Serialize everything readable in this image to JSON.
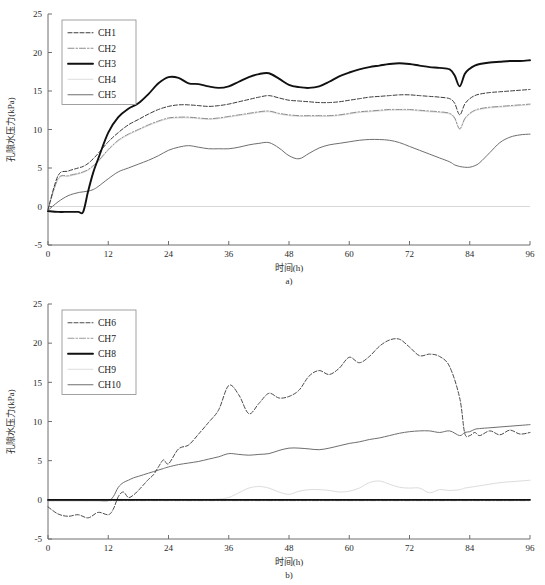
{
  "figure": {
    "panels": [
      {
        "id": "a",
        "sublabel": "a)",
        "xlabel": "时间(h)",
        "ylabel": "孔隙水压力(kPa)",
        "legend": [
          {
            "label": "CH1",
            "style": "dashed",
            "color": "#3a3a3a",
            "width": 1.0,
            "dash": "4,2"
          },
          {
            "label": "CH2",
            "style": "dashdot",
            "color": "#8c8c8c",
            "width": 1.0,
            "dash": "6,2,1.5,2"
          },
          {
            "label": "CH3",
            "style": "solid",
            "color": "#111111",
            "width": 1.9,
            "dash": "none"
          },
          {
            "label": "CH4",
            "style": "solid",
            "color": "#dcdcdc",
            "width": 1.0,
            "dash": "none"
          },
          {
            "label": "CH5",
            "style": "solid",
            "color": "#6e6e6e",
            "width": 1.0,
            "dash": "none"
          }
        ]
      },
      {
        "id": "b",
        "sublabel": "b)",
        "xlabel": "时间(h)",
        "ylabel": "孔隙水压力(kPa)",
        "legend": [
          {
            "label": "CH6",
            "style": "dashed",
            "color": "#4a4a4a",
            "width": 1.0,
            "dash": "4,2"
          },
          {
            "label": "CH7",
            "style": "dashdot",
            "color": "#9a9a9a",
            "width": 1.0,
            "dash": "6,2,1.5,2"
          },
          {
            "label": "CH8",
            "style": "solid",
            "color": "#111111",
            "width": 1.9,
            "dash": "none"
          },
          {
            "label": "CH9",
            "style": "solid",
            "color": "#dcdcdc",
            "width": 1.0,
            "dash": "none"
          },
          {
            "label": "CH10",
            "style": "solid",
            "color": "#6e6e6e",
            "width": 1.0,
            "dash": "none"
          }
        ]
      }
    ]
  },
  "chart_data": [
    {
      "type": "line",
      "panel": "a",
      "title": "",
      "xlabel": "时间(h)",
      "ylabel": "孔隙水压力(kPa)",
      "xlim": [
        0,
        96
      ],
      "ylim": [
        -5,
        25
      ],
      "xticks": [
        0,
        12,
        24,
        36,
        48,
        60,
        72,
        84,
        96
      ],
      "yticks": [
        -5,
        0,
        5,
        10,
        15,
        20,
        25
      ],
      "grid": false,
      "legend_position": "upper-left",
      "x": [
        0,
        2,
        4,
        6,
        7,
        8,
        9,
        10,
        12,
        14,
        16,
        18,
        20,
        22,
        24,
        26,
        28,
        30,
        32,
        34,
        36,
        38,
        40,
        42,
        44,
        46,
        48,
        50,
        52,
        54,
        56,
        58,
        60,
        62,
        64,
        66,
        68,
        70,
        72,
        74,
        76,
        78,
        80,
        81,
        82,
        83,
        84,
        85,
        86,
        88,
        90,
        92,
        94,
        96
      ],
      "series": [
        {
          "name": "CH1",
          "values": [
            -0.4,
            4.0,
            4.6,
            5.0,
            5.2,
            5.6,
            6.2,
            6.9,
            8.4,
            9.6,
            10.6,
            11.3,
            12.0,
            12.6,
            13.0,
            13.2,
            13.2,
            13.1,
            13.0,
            13.1,
            13.3,
            13.6,
            13.9,
            14.2,
            14.4,
            14.1,
            13.8,
            13.7,
            13.6,
            13.5,
            13.5,
            13.6,
            13.8,
            14.0,
            14.2,
            14.3,
            14.4,
            14.5,
            14.5,
            14.4,
            14.3,
            14.2,
            14.0,
            13.4,
            11.9,
            13.3,
            14.0,
            14.4,
            14.6,
            14.8,
            14.9,
            15.0,
            15.1,
            15.2
          ]
        },
        {
          "name": "CH2",
          "values": [
            -0.4,
            3.6,
            4.0,
            4.3,
            4.5,
            4.8,
            5.3,
            5.9,
            7.4,
            8.6,
            9.4,
            10.0,
            10.6,
            11.1,
            11.5,
            11.6,
            11.6,
            11.5,
            11.4,
            11.5,
            11.7,
            11.9,
            12.1,
            12.3,
            12.4,
            12.1,
            11.9,
            11.8,
            11.8,
            11.8,
            11.8,
            11.9,
            12.1,
            12.3,
            12.4,
            12.5,
            12.6,
            12.6,
            12.6,
            12.5,
            12.4,
            12.3,
            12.1,
            11.5,
            10.1,
            11.4,
            12.1,
            12.5,
            12.7,
            12.9,
            13.0,
            13.1,
            13.2,
            13.3
          ]
        },
        {
          "name": "CH3",
          "values": [
            -0.6,
            -0.7,
            -0.7,
            -0.7,
            -0.7,
            2.0,
            4.4,
            6.2,
            9.6,
            11.6,
            12.7,
            13.4,
            14.6,
            16.0,
            16.8,
            16.7,
            16.0,
            15.9,
            15.6,
            15.4,
            15.6,
            16.2,
            16.8,
            17.2,
            17.3,
            16.6,
            15.8,
            15.5,
            15.4,
            15.6,
            16.2,
            16.9,
            17.4,
            17.8,
            18.1,
            18.3,
            18.5,
            18.6,
            18.5,
            18.3,
            18.1,
            18.0,
            17.8,
            17.0,
            15.6,
            17.2,
            17.9,
            18.3,
            18.5,
            18.7,
            18.8,
            18.9,
            18.9,
            19.0
          ]
        },
        {
          "name": "CH4",
          "values": [
            -0.4,
            3.5,
            3.9,
            4.2,
            4.4,
            4.7,
            5.2,
            5.8,
            7.3,
            8.5,
            9.3,
            9.9,
            10.5,
            11.0,
            11.4,
            11.5,
            11.5,
            11.4,
            11.3,
            11.4,
            11.6,
            11.8,
            12.0,
            12.2,
            12.3,
            12.0,
            11.8,
            11.7,
            11.7,
            11.7,
            11.7,
            11.8,
            12.0,
            12.2,
            12.3,
            12.4,
            12.5,
            12.5,
            12.5,
            12.4,
            12.3,
            12.2,
            12.0,
            11.4,
            10.0,
            11.3,
            12.0,
            12.4,
            12.6,
            12.8,
            12.9,
            13.0,
            13.1,
            13.2
          ]
        },
        {
          "name": "CH5",
          "values": [
            -0.5,
            0.6,
            1.4,
            1.8,
            1.9,
            2.0,
            2.2,
            2.6,
            3.6,
            4.5,
            5.0,
            5.5,
            6.0,
            6.6,
            7.3,
            7.7,
            7.9,
            7.7,
            7.5,
            7.5,
            7.5,
            7.7,
            8.0,
            8.2,
            8.3,
            7.6,
            6.6,
            6.2,
            6.9,
            7.6,
            8.0,
            8.2,
            8.4,
            8.6,
            8.7,
            8.7,
            8.6,
            8.3,
            7.8,
            7.3,
            6.8,
            6.3,
            5.8,
            5.4,
            5.2,
            5.1,
            5.1,
            5.3,
            5.7,
            7.0,
            8.3,
            9.0,
            9.3,
            9.4
          ]
        }
      ]
    },
    {
      "type": "line",
      "panel": "b",
      "title": "",
      "xlabel": "时间(h)",
      "ylabel": "孔隙水压力(kPa)",
      "xlim": [
        0,
        96
      ],
      "ylim": [
        -5,
        25
      ],
      "xticks": [
        0,
        12,
        24,
        36,
        48,
        60,
        72,
        84,
        96
      ],
      "yticks": [
        -5,
        0,
        5,
        10,
        15,
        20,
        25
      ],
      "grid": false,
      "legend_position": "upper-left",
      "x": [
        0,
        2,
        4,
        6,
        8,
        10,
        12,
        13,
        14,
        15,
        16,
        17,
        18,
        19,
        20,
        21,
        22,
        23,
        24,
        26,
        28,
        30,
        32,
        34,
        36,
        38,
        40,
        42,
        44,
        46,
        48,
        50,
        52,
        54,
        56,
        58,
        60,
        62,
        64,
        66,
        68,
        70,
        72,
        74,
        76,
        78,
        80,
        82,
        83,
        84,
        85,
        86,
        88,
        90,
        92,
        94,
        96
      ],
      "series": [
        {
          "name": "CH6",
          "values": [
            -0.9,
            -1.8,
            -2.1,
            -1.9,
            -2.3,
            -1.6,
            -1.9,
            -1.2,
            0.4,
            1.0,
            0.3,
            0.6,
            1.2,
            1.9,
            2.6,
            3.2,
            4.2,
            5.1,
            4.6,
            6.5,
            7.0,
            8.4,
            9.9,
            11.5,
            14.6,
            13.4,
            11.0,
            12.3,
            13.6,
            13.0,
            13.2,
            14.0,
            15.8,
            16.5,
            16.0,
            16.8,
            18.2,
            17.5,
            18.3,
            19.6,
            20.4,
            20.5,
            19.5,
            18.4,
            18.6,
            18.3,
            17.0,
            13.0,
            8.5,
            8.2,
            8.6,
            8.2,
            8.8,
            8.3,
            8.9,
            8.4,
            8.6
          ]
        },
        {
          "name": "CH7",
          "values": [
            -0.1,
            -0.1,
            -0.1,
            -0.1,
            -0.1,
            -0.1,
            -0.1,
            -0.1,
            -0.1,
            -0.1,
            -0.1,
            -0.1,
            -0.1,
            -0.1,
            -0.1,
            -0.1,
            -0.1,
            -0.1,
            -0.1,
            -0.1,
            -0.1,
            -0.1,
            -0.1,
            -0.1,
            -0.1,
            -0.1,
            -0.1,
            -0.1,
            -0.1,
            -0.1,
            -0.1,
            -0.1,
            -0.1,
            -0.1,
            -0.1,
            -0.1,
            -0.1,
            -0.1,
            -0.1,
            -0.1,
            -0.1,
            -0.1,
            -0.1,
            -0.1,
            -0.1,
            -0.1,
            -0.1,
            -0.1,
            -0.1,
            -0.1,
            -0.1,
            -0.1,
            -0.1,
            -0.1,
            -0.1,
            -0.1,
            -0.1
          ]
        },
        {
          "name": "CH8",
          "values": [
            0.0,
            0.0,
            0.0,
            0.0,
            0.0,
            0.0,
            0.0,
            0.0,
            0.0,
            0.0,
            0.0,
            0.0,
            0.0,
            0.0,
            0.0,
            0.0,
            0.0,
            0.0,
            0.0,
            0.0,
            0.0,
            0.0,
            0.0,
            0.0,
            0.0,
            0.0,
            0.0,
            0.0,
            0.0,
            0.0,
            0.0,
            0.0,
            0.0,
            0.0,
            0.0,
            0.0,
            0.0,
            0.0,
            0.0,
            0.0,
            0.0,
            0.0,
            0.0,
            0.0,
            0.0,
            0.0,
            0.0,
            0.0,
            0.0,
            0.0,
            0.0,
            0.0,
            0.0,
            0.0,
            0.0,
            0.0,
            0.0
          ]
        },
        {
          "name": "CH9",
          "values": [
            0.05,
            0.05,
            0.05,
            0.05,
            0.05,
            0.05,
            0.05,
            0.05,
            0.05,
            0.05,
            0.05,
            0.05,
            0.05,
            0.05,
            0.05,
            0.05,
            0.05,
            0.05,
            0.05,
            0.05,
            0.05,
            0.05,
            0.05,
            0.1,
            0.3,
            0.9,
            1.5,
            1.7,
            1.5,
            1.0,
            0.7,
            1.1,
            1.3,
            1.3,
            1.2,
            1.0,
            1.1,
            1.5,
            2.2,
            2.4,
            2.0,
            1.6,
            1.5,
            1.5,
            0.9,
            1.3,
            1.2,
            1.3,
            1.5,
            1.6,
            1.7,
            1.8,
            2.0,
            2.2,
            2.3,
            2.4,
            2.5
          ]
        },
        {
          "name": "CH10",
          "values": [
            -0.1,
            -0.1,
            -0.1,
            -0.1,
            -0.1,
            -0.1,
            -0.1,
            0.4,
            1.6,
            2.2,
            2.5,
            2.8,
            3.0,
            3.2,
            3.4,
            3.6,
            3.8,
            4.0,
            4.2,
            4.5,
            4.7,
            4.9,
            5.2,
            5.5,
            5.9,
            5.8,
            5.7,
            5.8,
            5.9,
            6.3,
            6.6,
            6.6,
            6.5,
            6.4,
            6.6,
            6.9,
            7.2,
            7.4,
            7.7,
            7.9,
            8.2,
            8.5,
            8.7,
            8.8,
            8.8,
            8.6,
            8.8,
            8.2,
            8.6,
            8.7,
            9.0,
            9.1,
            9.2,
            9.3,
            9.4,
            9.5,
            9.6
          ]
        }
      ]
    }
  ]
}
